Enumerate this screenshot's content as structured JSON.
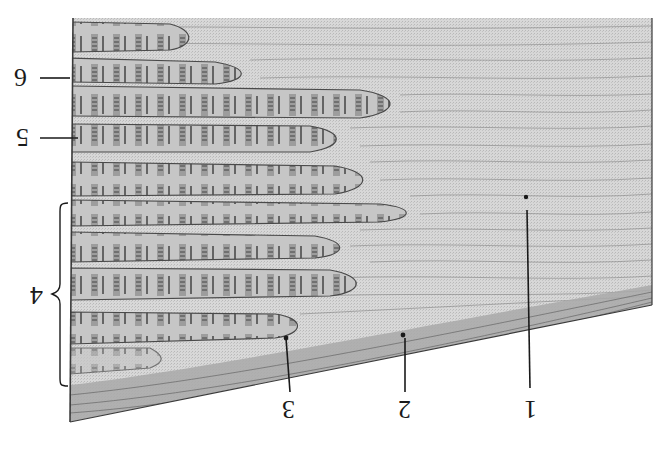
{
  "figure": {
    "orientation": "upside-down",
    "colors": {
      "tendon": "#d4d4d4",
      "tendon_lines": "#8a8a8a",
      "fiber_fill": "#bdbdbd",
      "fiber_outline": "#4a4a4a",
      "striation": "#555555",
      "dense_band": "#a8a8a8",
      "leader_line": "#1a1a1a"
    },
    "labels": [
      {
        "id": "1",
        "text": "1"
      },
      {
        "id": "2",
        "text": "2"
      },
      {
        "id": "3",
        "text": "3"
      },
      {
        "id": "4",
        "text": "4"
      },
      {
        "id": "5",
        "text": "5"
      },
      {
        "id": "6",
        "text": "6"
      }
    ],
    "fiber_count": 9
  }
}
